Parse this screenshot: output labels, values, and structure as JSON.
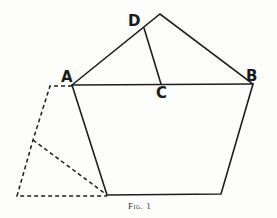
{
  "figure": {
    "caption": "Fig. 1",
    "labels": {
      "A": "A",
      "B": "B",
      "C": "C",
      "D": "D"
    }
  }
}
